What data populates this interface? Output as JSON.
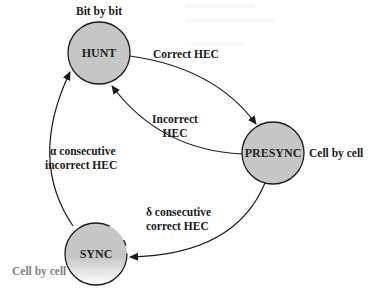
{
  "diagram": {
    "type": "state-machine",
    "colors": {
      "state_fill": "#c6c6c6",
      "stroke": "#1a1a1a",
      "text": "#1a1a1a",
      "background": "#ffffff"
    },
    "states": [
      {
        "id": "hunt",
        "label": "HUNT",
        "annotation": "Bit by bit"
      },
      {
        "id": "presync",
        "label": "PRESYNC",
        "annotation": "Cell by cell"
      },
      {
        "id": "sync",
        "label": "SYNC",
        "annotation": "Cell by cell"
      }
    ],
    "transitions": [
      {
        "from": "hunt",
        "to": "presync",
        "label_lines": [
          "Correct HEC"
        ]
      },
      {
        "from": "presync",
        "to": "hunt",
        "label_lines": [
          "Incorrect",
          "HEC"
        ]
      },
      {
        "from": "presync",
        "to": "sync",
        "label_lines": [
          "δ consecutive",
          "correct HEC"
        ]
      },
      {
        "from": "sync",
        "to": "hunt",
        "label_lines": [
          "α consecutive",
          "incorrect HEC"
        ]
      }
    ]
  }
}
